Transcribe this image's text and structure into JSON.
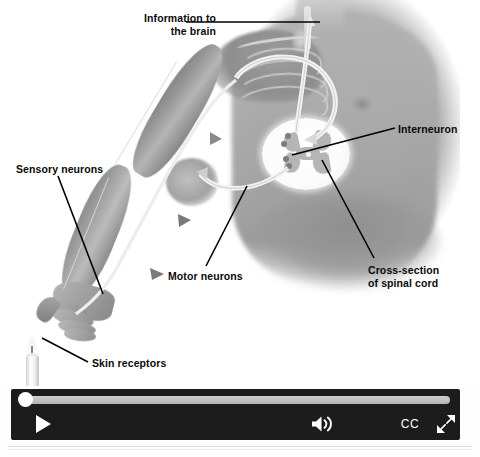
{
  "media": {
    "title": "Reflex arc: information pathway from skin receptors to the brain",
    "type": "anatomical-diagram-video"
  },
  "diagram": {
    "labels": [
      {
        "id": "information-to-brain",
        "text": "Information to\nthe brain",
        "align": "right"
      },
      {
        "id": "sensory-neurons",
        "text": "Sensory neurons",
        "align": "left"
      },
      {
        "id": "interneuron",
        "text": "Interneuron",
        "align": "left"
      },
      {
        "id": "motor-neurons",
        "text": "Motor neurons",
        "align": "left"
      },
      {
        "id": "cross-section-of-spinal-cord",
        "text": "Cross-section\nof spinal cord",
        "align": "left"
      },
      {
        "id": "skin-receptors",
        "text": "Skin receptors",
        "align": "left"
      }
    ],
    "elements": [
      "human-torso",
      "left-arm",
      "hand-with-extended-finger",
      "rib-cage",
      "spinal-cord-cross-section",
      "candle-flame"
    ],
    "colors": {
      "background": "#ffffff",
      "label_text": "#0b0b0b",
      "leader_line": "#000000",
      "torso_gray": "#a8a8a8",
      "spinal_cord_white": "#ffffff",
      "gray_matter": "#b5b5b5"
    }
  },
  "player": {
    "seek": {
      "value_percent": 0,
      "track_color": "#c2c2c2",
      "handle_color": "#ffffff"
    },
    "bar_color": "#1c1c1c",
    "buttons": [
      {
        "id": "play",
        "icon": "play-icon",
        "label": "Play"
      },
      {
        "id": "volume",
        "icon": "volume-icon",
        "label": "Volume"
      },
      {
        "id": "captions",
        "icon": "cc-icon",
        "label": "CC"
      },
      {
        "id": "fullscreen",
        "icon": "fullscreen-icon",
        "label": "Full screen"
      }
    ],
    "captions_label": "CC"
  }
}
